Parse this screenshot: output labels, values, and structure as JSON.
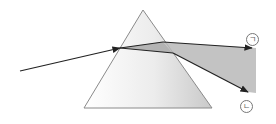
{
  "diagram": {
    "type": "prism-dispersion",
    "labels": {
      "top_ray": "ㄱ",
      "bottom_ray": "ㄴ"
    },
    "colors": {
      "prism_edge": "#8a8a8a",
      "prism_fill_light": "#ffffff",
      "prism_fill_dark": "#c8c8c8",
      "beam_fill": "#b9b9b9",
      "ray": "#222222"
    }
  }
}
